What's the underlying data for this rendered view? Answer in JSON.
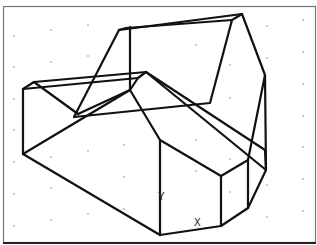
{
  "drawing": {
    "type": "wireframe-3d-solid",
    "view": "isometric",
    "line_color": "#111111",
    "background_color": "#ffffff",
    "frame_color": "#555555",
    "grid_dot_color": "#8a8a8a"
  },
  "ucs_icon": {
    "y_label": "Y",
    "x_label": "X"
  }
}
